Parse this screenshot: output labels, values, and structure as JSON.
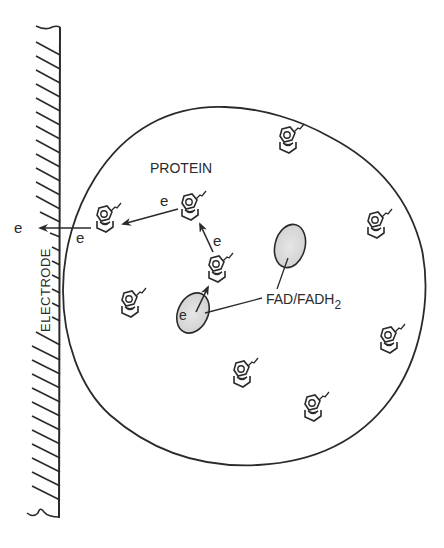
{
  "diagram": {
    "labels": {
      "electrode": "ELECTRODE",
      "protein": "PROTEIN",
      "cofactor": "FAD/FADH",
      "cofactor_subscript": "2",
      "electron": "e"
    },
    "electron_labels": [
      {
        "id": "e-outside",
        "text": "e"
      },
      {
        "id": "e-electrode-side",
        "text": "e"
      },
      {
        "id": "e-transfer-1",
        "text": "e"
      },
      {
        "id": "e-transfer-2",
        "text": "e"
      },
      {
        "id": "e-from-fad",
        "text": "e"
      }
    ],
    "colors": {
      "ink": "#2a2a2a",
      "fad_fill": "#d9d9d9",
      "background": "#ffffff"
    },
    "molecule_count": 9,
    "fad_count": 2
  }
}
